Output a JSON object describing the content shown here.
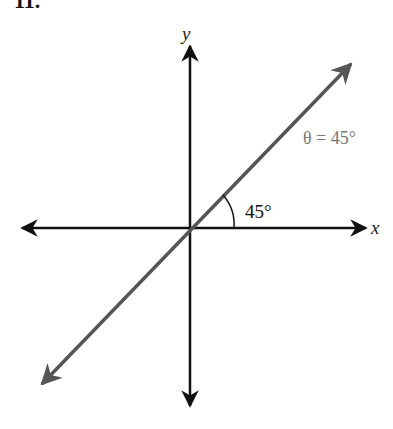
{
  "problem_number": "11.",
  "diagram": {
    "x_axis_label": "x",
    "y_axis_label": "y",
    "angle_label": "45°",
    "line_label": "θ = 45°",
    "colors": {
      "axes": "#111111",
      "terminal_line": "#555555",
      "line_label": "#777777"
    }
  }
}
